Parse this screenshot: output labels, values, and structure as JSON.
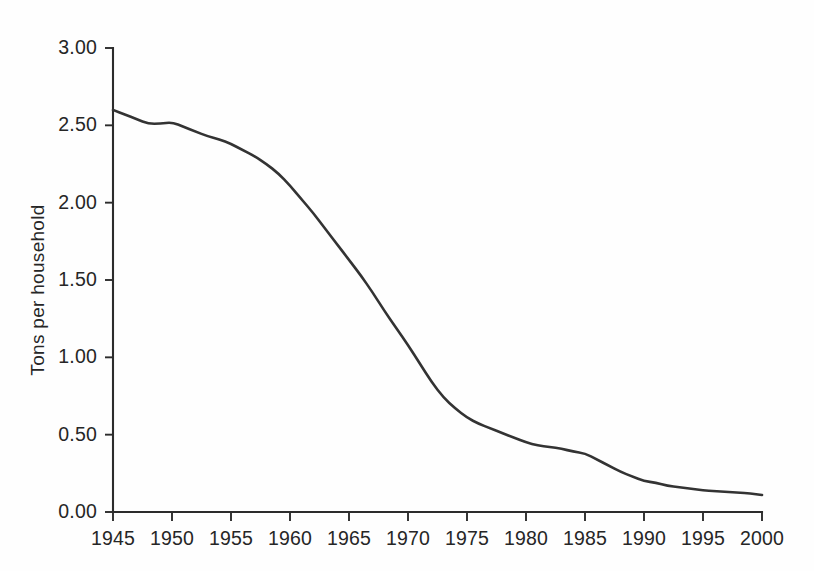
{
  "chart_data": {
    "type": "line",
    "title": "",
    "subtitle": "",
    "xlabel": "",
    "ylabel": "Tons per household",
    "xlim": [
      1945,
      2000
    ],
    "ylim": [
      0.0,
      3.0
    ],
    "grid": false,
    "legend": null,
    "legend_position": "none",
    "x_ticks": [
      1945,
      1950,
      1955,
      1960,
      1965,
      1970,
      1975,
      1980,
      1985,
      1990,
      1995,
      2000
    ],
    "x_tick_labels": [
      "1945",
      "1950",
      "1955",
      "1960",
      "1965",
      "1970",
      "1975",
      "1980",
      "1985",
      "1990",
      "1995",
      "2000"
    ],
    "y_ticks": [
      0.0,
      0.5,
      1.0,
      1.5,
      2.0,
      2.5,
      3.0
    ],
    "y_tick_labels": [
      "0.00",
      "0.50",
      "1.00",
      "1.50",
      "2.00",
      "2.50",
      "3.00"
    ],
    "line_color": "#333333",
    "background_color": "#fefefe",
    "axis_color": "#2c2c2c",
    "x": [
      1945,
      1946,
      1947,
      1948,
      1949,
      1950,
      1951,
      1952,
      1953,
      1954,
      1955,
      1956,
      1957,
      1958,
      1959,
      1960,
      1961,
      1962,
      1963,
      1964,
      1965,
      1966,
      1967,
      1968,
      1969,
      1970,
      1971,
      1972,
      1973,
      1974,
      1975,
      1976,
      1977,
      1978,
      1979,
      1980,
      1981,
      1982,
      1983,
      1984,
      1985,
      1986,
      1987,
      1988,
      1989,
      1990,
      1991,
      1992,
      1993,
      1994,
      1995,
      1996,
      1997,
      1998,
      1999,
      2000
    ],
    "values": [
      2.6,
      2.57,
      2.54,
      2.51,
      2.51,
      2.52,
      2.49,
      2.46,
      2.43,
      2.41,
      2.38,
      2.34,
      2.3,
      2.25,
      2.19,
      2.11,
      2.02,
      1.93,
      1.83,
      1.73,
      1.63,
      1.53,
      1.42,
      1.3,
      1.19,
      1.08,
      0.96,
      0.84,
      0.74,
      0.67,
      0.61,
      0.57,
      0.54,
      0.51,
      0.48,
      0.45,
      0.43,
      0.42,
      0.41,
      0.39,
      0.38,
      0.34,
      0.3,
      0.26,
      0.23,
      0.2,
      0.19,
      0.17,
      0.16,
      0.15,
      0.14,
      0.135,
      0.13,
      0.125,
      0.12,
      0.11
    ],
    "series": [
      {
        "name": "Tons per household",
        "values": [
          2.6,
          2.57,
          2.54,
          2.51,
          2.51,
          2.52,
          2.49,
          2.46,
          2.43,
          2.41,
          2.38,
          2.34,
          2.3,
          2.25,
          2.19,
          2.11,
          2.02,
          1.93,
          1.83,
          1.73,
          1.63,
          1.53,
          1.42,
          1.3,
          1.19,
          1.08,
          0.96,
          0.84,
          0.74,
          0.67,
          0.61,
          0.57,
          0.54,
          0.51,
          0.48,
          0.45,
          0.43,
          0.42,
          0.41,
          0.39,
          0.38,
          0.34,
          0.3,
          0.26,
          0.23,
          0.2,
          0.19,
          0.17,
          0.16,
          0.15,
          0.14,
          0.135,
          0.13,
          0.125,
          0.12,
          0.11
        ]
      }
    ],
    "annotations": []
  }
}
